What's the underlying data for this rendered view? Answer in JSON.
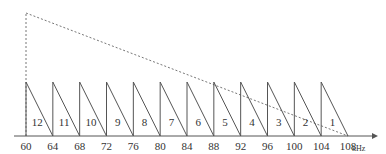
{
  "diagram": {
    "unit": "kHz",
    "axis": {
      "min": 60,
      "max": 108,
      "ticks": [
        60,
        64,
        68,
        72,
        76,
        80,
        84,
        88,
        92,
        96,
        100,
        104,
        108
      ]
    },
    "channels": [
      {
        "label": "12",
        "start": 60,
        "end": 64
      },
      {
        "label": "11",
        "start": 64,
        "end": 68
      },
      {
        "label": "10",
        "start": 68,
        "end": 72
      },
      {
        "label": "9",
        "start": 72,
        "end": 76
      },
      {
        "label": "8",
        "start": 76,
        "end": 80
      },
      {
        "label": "7",
        "start": 80,
        "end": 84
      },
      {
        "label": "6",
        "start": 84,
        "end": 88
      },
      {
        "label": "5",
        "start": 88,
        "end": 92
      },
      {
        "label": "4",
        "start": 92,
        "end": 96
      },
      {
        "label": "3",
        "start": 96,
        "end": 100
      },
      {
        "label": "2",
        "start": 100,
        "end": 104
      },
      {
        "label": "1",
        "start": 104,
        "end": 108
      }
    ],
    "envelope": {
      "style": "dashed",
      "from": 60,
      "to": 108,
      "description": "overall group spectrum, highest at 60 kHz, falling to 0 at 108 kHz"
    },
    "colors": {
      "line": "#555555",
      "dashed": "#777777"
    }
  }
}
